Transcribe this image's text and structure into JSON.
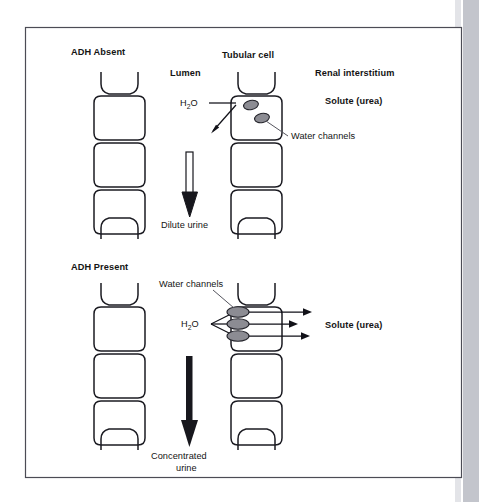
{
  "figure": {
    "frame": {
      "border_color": "#4c4c55",
      "background": "#ffffff"
    }
  },
  "colors": {
    "cell_outline": "#1b1b22",
    "water_channel_fill": "#8c8c93",
    "water_channel_stroke": "#23232a",
    "text": "#141414",
    "leader_line": "#55555e",
    "arrow": "#111118",
    "page_edge_strip": "#c3c5cc"
  },
  "panels": [
    {
      "id": "adh-absent",
      "title": "ADH Absent",
      "title_bold": true,
      "region_labels": [
        {
          "name": "lumen",
          "text": "Lumen",
          "bold": true
        },
        {
          "name": "tubular-cell",
          "text": "Tubular cell",
          "bold": true
        },
        {
          "name": "renal-interstitium",
          "text": "Renal interstitium",
          "bold": true
        },
        {
          "name": "solute-urea",
          "text": "Solute (urea)",
          "bold": true
        }
      ],
      "water_label": {
        "text": "H2O",
        "base": "H",
        "subscript": "2",
        "suffix": "O"
      },
      "channel_label": {
        "text": "Water channels",
        "bold": false
      },
      "channel_count": 2,
      "channel_placement": "internal-cytoplasm",
      "urine_arrow": {
        "label": "Dilute urine",
        "style": "hollow-outline-shaft",
        "direction": "down"
      },
      "water_flow": "minimal-reabsorption"
    },
    {
      "id": "adh-present",
      "title": "ADH Present",
      "title_bold": true,
      "region_labels": [
        {
          "name": "solute-urea",
          "text": "Solute (urea)",
          "bold": true
        }
      ],
      "water_label": {
        "text": "H2O",
        "base": "H",
        "subscript": "2",
        "suffix": "O"
      },
      "channel_label": {
        "text": "Water channels",
        "bold": false
      },
      "channel_count": 3,
      "channel_placement": "apical-membrane-inserted",
      "urine_arrow": {
        "label_line1": "Concentrated",
        "label_line2": "urine",
        "style": "solid-filled",
        "direction": "down"
      },
      "water_flow": "high-reabsorption",
      "flow_arrow_count": 3
    }
  ]
}
